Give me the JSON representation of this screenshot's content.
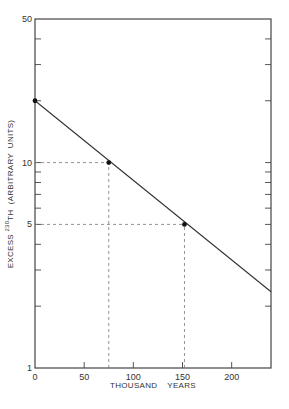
{
  "chart_data": {
    "type": "line",
    "title": "",
    "xlabel": "THOUSAND    YEARS",
    "ylabel_parts": {
      "prefix": "EXCESS ",
      "superscript": "230",
      "suffix": "TH  (ARBITRARY  UNITS)"
    },
    "ylabel": "EXCESS 230TH (ARBITRARY UNITS)",
    "x_scale": "linear",
    "y_scale": "log",
    "xlim": [
      0,
      240
    ],
    "ylim": [
      1,
      50
    ],
    "x_ticks": [
      0,
      50,
      100,
      150,
      200
    ],
    "x_tick_labels": [
      "0",
      "50",
      "100",
      "150",
      "200"
    ],
    "y_labeled_ticks": [
      1,
      5,
      10,
      50
    ],
    "y_tick_labels": [
      "1",
      "5",
      "10",
      "50"
    ],
    "y_minor_ticks": [
      2,
      3,
      4,
      6,
      7,
      8,
      9,
      20,
      30,
      40
    ],
    "grid": false,
    "legend": null,
    "series": [
      {
        "name": "decay line",
        "x": [
          0,
          240
        ],
        "values": [
          20,
          2.35
        ]
      }
    ],
    "marked_points": [
      {
        "x": 0,
        "y": 20
      },
      {
        "x": 75,
        "y": 10
      },
      {
        "x": 152,
        "y": 5
      }
    ],
    "reference_lines": [
      {
        "type": "horizontal-dashed",
        "y": 10,
        "from_x": 0,
        "to_x": 75
      },
      {
        "type": "vertical-dashed",
        "x": 75,
        "from_y": 1,
        "to_y": 10
      },
      {
        "type": "horizontal-dashed",
        "y": 5,
        "from_x": 0,
        "to_x": 152
      },
      {
        "type": "vertical-dashed",
        "x": 152,
        "from_y": 1,
        "to_y": 5
      }
    ]
  }
}
